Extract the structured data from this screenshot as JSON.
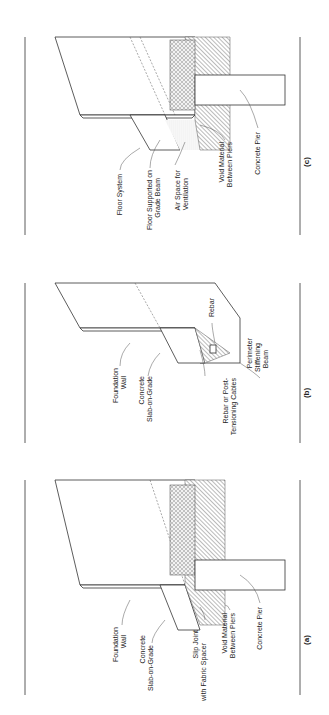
{
  "figure": {
    "panels": [
      {
        "id": "a",
        "caption": "(a)",
        "labels": {
          "foundation_wall_1": "Foundation",
          "foundation_wall_2": "Wall",
          "slab_1": "Concrete",
          "slab_2": "Slab-on-Grade",
          "slip_1": "Slip Joint",
          "slip_2": "with Fabric Spacer",
          "void_1": "Void Material",
          "void_2": "Between Piers",
          "pier": "Concrete Pier"
        }
      },
      {
        "id": "b",
        "caption": "(b)",
        "labels": {
          "foundation_wall_1": "Foundation",
          "foundation_wall_2": "Wall",
          "slab_1": "Concrete",
          "slab_2": "Slab-on-Grade",
          "rebar": "Rebar",
          "cables_1": "Rebar or Post-",
          "cables_2": "Tensioning Cables",
          "beam_1": "Perimeter",
          "beam_2": "Stiffening",
          "beam_3": "Beam"
        }
      },
      {
        "id": "c",
        "caption": "(c)",
        "labels": {
          "floor_system": "Floor System",
          "grade_beam_1": "Floor Supported on",
          "grade_beam_2": "Grade Beam",
          "air_1": "Air Space for",
          "air_2": "Ventilation",
          "void_1": "Void Material",
          "void_2": "Between Piers",
          "pier": "Concrete Pier"
        }
      }
    ]
  }
}
